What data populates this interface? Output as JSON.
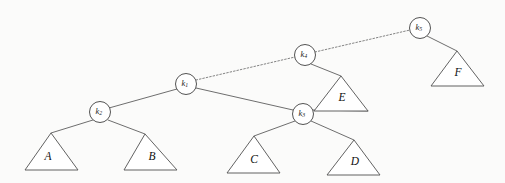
{
  "figure": {
    "kind": "binary-tree-diagram",
    "background_color": "#fbfbfa",
    "stroke_color": "#5a5a5a",
    "label_color": "#101010",
    "width": 505,
    "height": 183
  },
  "nodes": [
    {
      "id": "k1",
      "base": "k",
      "subscript": "1",
      "cx": 186,
      "cy": 84,
      "r": 10.5
    },
    {
      "id": "k2",
      "base": "k",
      "subscript": "2",
      "cx": 100,
      "cy": 112,
      "r": 10.5
    },
    {
      "id": "k3",
      "base": "k",
      "subscript": "3",
      "cx": 303,
      "cy": 114,
      "r": 10.5
    },
    {
      "id": "k4",
      "base": "k",
      "subscript": "4",
      "cx": 305,
      "cy": 55,
      "r": 10.5
    },
    {
      "id": "k5",
      "base": "k",
      "subscript": "5",
      "cx": 420,
      "cy": 28,
      "r": 10.5
    }
  ],
  "subtrees": [
    {
      "id": "A",
      "label": "A",
      "apex_x": 51,
      "apex_y": 133,
      "left_x": 25,
      "right_x": 78,
      "base_y": 170,
      "label_x": 48,
      "label_y": 157
    },
    {
      "id": "B",
      "label": "B",
      "apex_x": 145,
      "apex_y": 134,
      "left_x": 124,
      "right_x": 177,
      "base_y": 170,
      "label_x": 152,
      "label_y": 157
    },
    {
      "id": "C",
      "label": "C",
      "apex_x": 254,
      "apex_y": 136,
      "left_x": 227,
      "right_x": 280,
      "base_y": 173,
      "label_x": 254,
      "label_y": 160
    },
    {
      "id": "D",
      "label": "D",
      "apex_x": 354,
      "apex_y": 140,
      "left_x": 327,
      "right_x": 380,
      "base_y": 175,
      "label_x": 355,
      "label_y": 162
    },
    {
      "id": "E",
      "label": "E",
      "apex_x": 341,
      "apex_y": 76,
      "left_x": 314,
      "right_x": 368,
      "base_y": 111,
      "label_x": 342,
      "label_y": 98
    },
    {
      "id": "F",
      "label": "F",
      "apex_x": 457,
      "apex_y": 51,
      "left_x": 431,
      "right_x": 484,
      "base_y": 86,
      "label_x": 458,
      "label_y": 73
    }
  ],
  "edges": [
    {
      "id": "k1-k2",
      "from": "k1",
      "to": "k2",
      "style": "solid",
      "x1": 177,
      "y1": 89,
      "x2": 109,
      "y2": 108
    },
    {
      "id": "k1-k3",
      "from": "k1",
      "to": "k3",
      "style": "solid",
      "x1": 196,
      "y1": 88,
      "x2": 293,
      "y2": 110
    },
    {
      "id": "k1-k4",
      "from": "k1",
      "to": "k4",
      "style": "dotted",
      "x1": 196,
      "y1": 80,
      "x2": 295,
      "y2": 57
    },
    {
      "id": "k4-k5",
      "from": "k4",
      "to": "k5",
      "style": "dotted",
      "x1": 315,
      "y1": 52,
      "x2": 410,
      "y2": 30
    },
    {
      "id": "k2-A",
      "from": "k2",
      "to": "A",
      "style": "solid",
      "x1": 93,
      "y1": 120,
      "x2": 51,
      "y2": 133
    },
    {
      "id": "k2-B",
      "from": "k2",
      "to": "B",
      "style": "solid",
      "x1": 108,
      "y1": 120,
      "x2": 145,
      "y2": 134
    },
    {
      "id": "k3-C",
      "from": "k3",
      "to": "C",
      "style": "solid",
      "x1": 295,
      "y1": 121,
      "x2": 254,
      "y2": 136
    },
    {
      "id": "k3-D",
      "from": "k3",
      "to": "D",
      "style": "solid",
      "x1": 311,
      "y1": 121,
      "x2": 354,
      "y2": 140
    },
    {
      "id": "k3-E",
      "from": "k3",
      "to": "E",
      "style": "solid",
      "x1": 312,
      "y1": 110,
      "x2": 368,
      "y2": 111
    },
    {
      "id": "k4-E",
      "from": "k4",
      "to": "E",
      "style": "solid",
      "x1": 311,
      "y1": 64,
      "x2": 341,
      "y2": 76
    },
    {
      "id": "k5-F",
      "from": "k5",
      "to": "F",
      "style": "solid",
      "x1": 427,
      "y1": 36,
      "x2": 457,
      "y2": 51
    }
  ]
}
